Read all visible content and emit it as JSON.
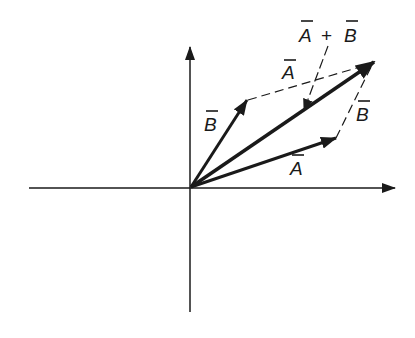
{
  "diagram": {
    "type": "vector-addition-parallelogram",
    "colors": {
      "ink": "#1a1a1a",
      "background": "#ffffff"
    },
    "axes": {
      "origin": [
        191,
        187
      ],
      "x_axis": {
        "from": [
          29,
          188
        ],
        "to": [
          393,
          188
        ]
      },
      "y_axis": {
        "from": [
          190,
          312
        ],
        "to": [
          190,
          48
        ]
      }
    },
    "vectors": [
      {
        "id": "A",
        "label": "A",
        "from": [
          191,
          187
        ],
        "to": [
          336,
          138
        ],
        "style": "solid"
      },
      {
        "id": "B",
        "label": "B",
        "from": [
          191,
          187
        ],
        "to": [
          247,
          100
        ],
        "style": "solid"
      },
      {
        "id": "A_plus_B",
        "label": "A + B",
        "from": [
          191,
          187
        ],
        "to": [
          373,
          63
        ],
        "style": "solid-bold"
      }
    ],
    "dashed_edges": [
      {
        "id": "A-translated",
        "label": "A",
        "from": [
          247,
          100
        ],
        "to": [
          373,
          63
        ]
      },
      {
        "id": "B-translated",
        "label": "B",
        "from": [
          336,
          138
        ],
        "to": [
          373,
          63
        ]
      }
    ],
    "labels": {
      "sum": {
        "text_a": "A",
        "plus": "+",
        "text_b": "B"
      },
      "a_bottom": "A",
      "a_top": "A",
      "b_left": "B",
      "b_right": "B"
    }
  }
}
